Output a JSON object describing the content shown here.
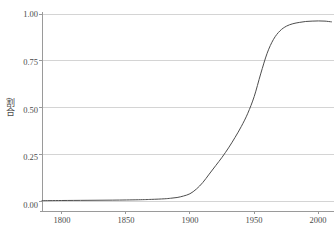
{
  "chart_data": {
    "type": "line",
    "title": "",
    "subtitle": "",
    "xlabel": "年",
    "ylabel": "割合",
    "xlim": [
      1785,
      2012
    ],
    "ylim": [
      -0.02,
      1.0
    ],
    "grid": true,
    "legend": "none",
    "x_ticks": [
      1800,
      1850,
      1900,
      1950,
      2000
    ],
    "x_tick_labels": [
      "1800",
      "1850",
      "1900",
      "1950",
      "2000"
    ],
    "y_ticks": [
      0.0,
      0.25,
      0.5,
      0.75,
      1.0
    ],
    "y_tick_labels": [
      "0.00",
      "0.25",
      "0.50",
      "0.75",
      "1.00"
    ],
    "line_color": "#4d4d4d",
    "grid_color": "#d4d4d4",
    "axis_color": "#9a9a9a",
    "background_color": "#ffffff",
    "series": [
      {
        "name": "割合",
        "x": [
          1785,
          1800,
          1820,
          1840,
          1860,
          1870,
          1880,
          1885,
          1890,
          1895,
          1900,
          1905,
          1910,
          1915,
          1920,
          1925,
          1930,
          1935,
          1940,
          1945,
          1950,
          1955,
          1960,
          1965,
          1970,
          1975,
          1980,
          1985,
          1990,
          1995,
          2000,
          2005,
          2010
        ],
        "values": [
          0.003,
          0.004,
          0.005,
          0.006,
          0.008,
          0.01,
          0.013,
          0.016,
          0.02,
          0.028,
          0.04,
          0.065,
          0.1,
          0.145,
          0.19,
          0.235,
          0.285,
          0.34,
          0.4,
          0.47,
          0.56,
          0.68,
          0.79,
          0.865,
          0.91,
          0.935,
          0.948,
          0.955,
          0.96,
          0.962,
          0.963,
          0.962,
          0.958
        ]
      }
    ]
  }
}
